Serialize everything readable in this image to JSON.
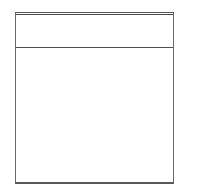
{
  "panel": {
    "header": {
      "title": ""
    },
    "body": {
      "content": ""
    }
  },
  "colors": {
    "border": "#6a6a6a",
    "rule": "#4f4f4f",
    "background": "#ffffff"
  }
}
